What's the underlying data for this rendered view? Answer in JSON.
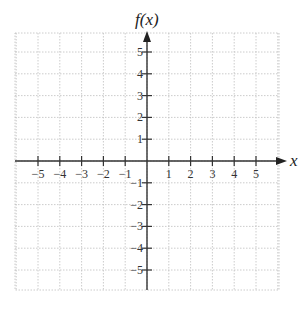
{
  "chart_data": {
    "type": "line",
    "title": "",
    "xlabel": "x",
    "ylabel": "f(x)",
    "xlim": [
      -6,
      6
    ],
    "ylim": [
      -6,
      6
    ],
    "grid": true,
    "grid_style": "dotted",
    "x_ticks": [
      -5,
      -4,
      -3,
      -2,
      -1,
      1,
      2,
      3,
      4,
      5
    ],
    "x_tick_labels": [
      "−5",
      "−4",
      "−3",
      "−2",
      "−1",
      "1",
      "2",
      "3",
      "4",
      "5"
    ],
    "y_ticks": [
      5,
      4,
      3,
      2,
      1,
      -1,
      -2,
      -3,
      -4,
      -5
    ],
    "y_tick_labels": [
      "5",
      "4",
      "3",
      "2",
      "1",
      "−1",
      "−2",
      "−3",
      "−4",
      "−5"
    ],
    "series": [],
    "legend": null
  },
  "labels": {
    "x_axis_title": "x",
    "y_axis_title": "f(x)"
  },
  "colors": {
    "axis": "#333333",
    "grid": "#bfbfbf",
    "text": "#333333"
  }
}
